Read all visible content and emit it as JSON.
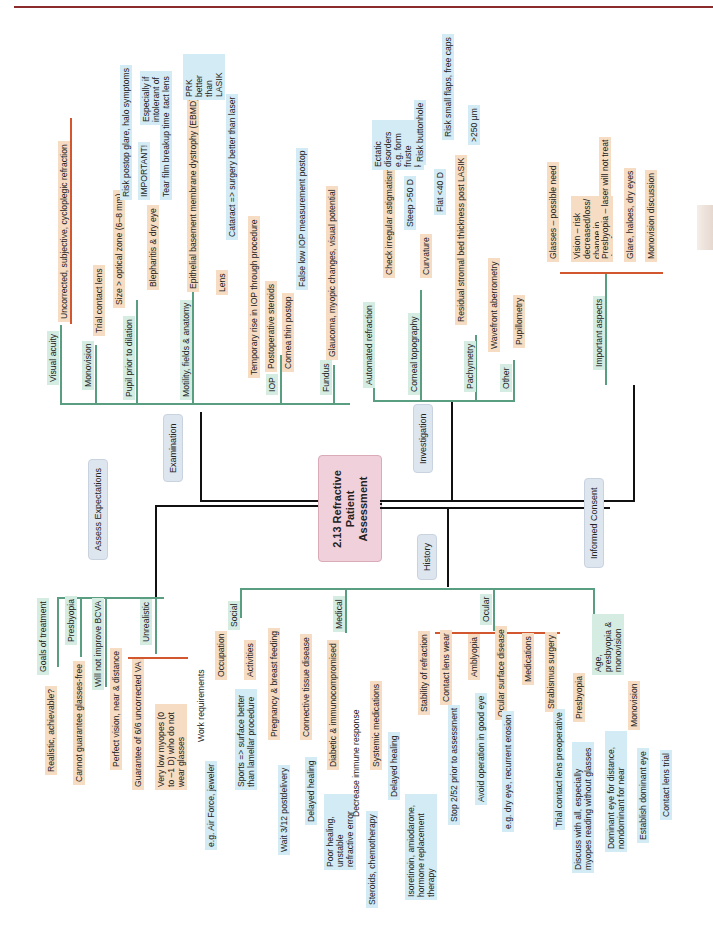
{
  "page": {
    "header_rule_color": "#8b2b2b"
  },
  "colors": {
    "level1": "#111111",
    "level2_teal": "#5a9e82",
    "level3_orange": "#d2562e",
    "level4_blue": "#3e5fa3",
    "center_fill": "#f0d0da",
    "category_fill": "#dde5ef"
  },
  "center": {
    "title": "2.13 Refractive Patient Assessment"
  },
  "branches": {
    "examination": {
      "label": "Examination",
      "items": {
        "visual_acuity": {
          "label": "Visual acuity",
          "children": [
            "Uncorrected, subjective, cycloplegic refraction"
          ]
        },
        "monovision": {
          "label": "Monovision",
          "children": [
            "Trial contact lens"
          ]
        },
        "pupil": {
          "label": "Pupil prior to dilation",
          "size": "Size > optical zone (6–8 mm)",
          "risk": "Risk postop glare, halo symptoms"
        },
        "motility": {
          "label": "Motility, fields & anatomy",
          "blepharitis": "Blepharitis & dry eye",
          "important": "IMPORTANT!",
          "intolerant": "Especially if intolerant of contact lens",
          "tear_film": "Tear film breakup time",
          "ebmd": "Epithelial basement membrane dystrophy (EBMD)",
          "prk": "PRK better than LASIK",
          "lens": "Lens",
          "cataract": "Cataract => surgery better than laser"
        },
        "iop": {
          "label": "IOP",
          "temp_rise": "Temporary rise in IOP through procedure",
          "steroids": "Postoperative steroids",
          "cornea_thin": "Cornea thin postop",
          "false_low": "False low IOP measurement postop"
        },
        "fundus": {
          "label": "Fundus",
          "children": [
            "Glaucoma, myopic changes, visual potential"
          ]
        }
      }
    },
    "investigation": {
      "label": "Investigation",
      "items": {
        "automated_refraction": {
          "label": "Automated refraction"
        },
        "corneal_topography": {
          "label": "Corneal topography",
          "check_irregular": "Check irregular astigmatism",
          "ectatic": "Ectatic disorders e.g. form fruste keratoconus",
          "curvature": "Curvature",
          "steep": "Steep >50 D",
          "risk_buttonhole": "Risk buttonhole",
          "flat": "Flat <40 D",
          "risk_flaps": "Risk small flaps, free caps"
        },
        "pachymetry": {
          "label": "Pachymetry",
          "residual": "Residual stromal bed thickness post LASIK",
          "value": ">250 μm"
        },
        "other": {
          "label": "Other",
          "children": [
            "Wavefront aberrometry",
            "Pupillometry"
          ]
        }
      }
    },
    "informed_consent": {
      "label": "Informed Consent",
      "important_aspects": {
        "label": "Important aspects",
        "children": [
          "Glasses – possible need",
          "Vision – risk decreased/loss/ change in quality",
          "Presbyopia – laser will not treat",
          "Glare, haloes, dry eyes",
          "Monovision discussion"
        ]
      }
    },
    "assess_expectations": {
      "label": "Assess Expectations",
      "goals": {
        "label": "Goals of treatment",
        "child": "Realistic, achievable?"
      },
      "presbyopia": {
        "label": "Presbyopia",
        "child": "Cannot guarantee glasses-free"
      },
      "bcva": {
        "label": "Will not improve BCVA"
      },
      "unrealistic": {
        "label": "Unrealistic",
        "children": [
          "Perfect vision, near & distance",
          "Guarantee of 6/6 uncorrected VA",
          "Very low myopes (0 to –1 D) who do not wear glasses"
        ]
      }
    },
    "history": {
      "label": "History",
      "social": {
        "label": "Social",
        "occupation": "Occupation",
        "work": "Work requirements",
        "work_eg": "e.g. Air Force, jeweler",
        "activities": "Activities",
        "sports": "Sports => surface better than lamellar procedure"
      },
      "medical": {
        "label": "Medical",
        "pregnancy": "Pregnancy & breast feeding",
        "wait": "Wait 3/12 postdelivery",
        "connective": "Connective tissue disease",
        "delayed1": "Delayed healing",
        "diabetic": "Diabetic & immunocompromised",
        "poor_healing": "Poor healing, unstable refractive error",
        "decrease_immune": "Decrease immune response",
        "steroids": "Steroids, chemotherapy",
        "systemic": "Systemic medications",
        "delayed2": "Delayed healing",
        "isotretinoin": "Isoretinoin, amiodarone, hormone replacement therapy"
      },
      "ocular": {
        "label": "Ocular",
        "stability": "Stability of refraction",
        "contact_lens": "Contact lens wear",
        "stop": "Stop 2/52 prior to assessment",
        "amblyopia": "Amblyopia",
        "avoid": "Avoid operation in good eye",
        "ocular_surface": "Ocular surface disease",
        "dry_eye": "e.g. dry eye, recurrent erosion",
        "medications": "Medications",
        "strabismus": "Strabismus surgery",
        "trial": "Trial contact lens preoperative"
      },
      "age": {
        "label": "Age, presbyopia & monovision",
        "presbyopia": "Presbyopia",
        "discuss": "Discuss with all, especially myopes reading without glasses",
        "monovision": "Monovision",
        "dominant": "Dominant eye for distance, nondominant for near",
        "establish": "Establish dominant eye",
        "cl_trial": "Contact lens trial"
      }
    }
  }
}
